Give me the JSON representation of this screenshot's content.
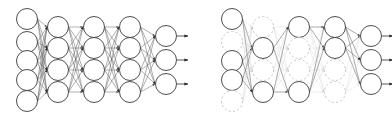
{
  "figure": {
    "name": "dropout-neural-network-comparison",
    "background": "#ffffff",
    "width": 392,
    "height": 121,
    "panels": [
      {
        "id": "standard-network",
        "name": "standard-neural-net",
        "x_offset": 0,
        "edge_color": "#555555",
        "edge_opacity": 0.85,
        "node_stroke": "#3a3a3a",
        "node_fill": "#ffffff",
        "layers": [
          {
            "id": "input-layer",
            "name": "input-layer",
            "cx": 27,
            "r": 10.5,
            "nodes": [
              {
                "id": "in-1",
                "cy": 19,
                "dropped": false
              },
              {
                "id": "in-2",
                "cy": 42,
                "dropped": false
              },
              {
                "id": "in-3",
                "cy": 61,
                "dropped": false
              },
              {
                "id": "in-4",
                "cy": 80,
                "dropped": false
              },
              {
                "id": "in-5",
                "cy": 101,
                "dropped": false
              }
            ]
          },
          {
            "id": "hidden-layer-1",
            "name": "hidden-layer-1",
            "cx": 58,
            "r": 10.5,
            "nodes": [
              {
                "id": "h1-1",
                "cy": 27,
                "dropped": false
              },
              {
                "id": "h1-2",
                "cy": 48,
                "dropped": false
              },
              {
                "id": "h1-3",
                "cy": 70,
                "dropped": false
              },
              {
                "id": "h1-4",
                "cy": 92,
                "dropped": false
              }
            ]
          },
          {
            "id": "hidden-layer-2",
            "name": "hidden-layer-2",
            "cx": 94,
            "r": 10.5,
            "nodes": [
              {
                "id": "h2-1",
                "cy": 27,
                "dropped": false
              },
              {
                "id": "h2-2",
                "cy": 48,
                "dropped": false
              },
              {
                "id": "h2-3",
                "cy": 70,
                "dropped": false
              },
              {
                "id": "h2-4",
                "cy": 92,
                "dropped": false
              }
            ]
          },
          {
            "id": "hidden-layer-3",
            "name": "hidden-layer-3",
            "cx": 130,
            "r": 10.5,
            "nodes": [
              {
                "id": "h3-1",
                "cy": 27,
                "dropped": false
              },
              {
                "id": "h3-2",
                "cy": 48,
                "dropped": false
              },
              {
                "id": "h3-3",
                "cy": 70,
                "dropped": false
              },
              {
                "id": "h3-4",
                "cy": 92,
                "dropped": false
              }
            ]
          },
          {
            "id": "output-layer",
            "name": "output-layer",
            "cx": 166,
            "r": 10.5,
            "nodes": [
              {
                "id": "out-1",
                "cy": 36,
                "dropped": false
              },
              {
                "id": "out-2",
                "cy": 60,
                "dropped": false
              },
              {
                "id": "out-3",
                "cy": 84,
                "dropped": false
              }
            ]
          }
        ],
        "output_arrows": [
          {
            "id": "out-arrow-1",
            "x1": 177,
            "y": 36,
            "x2": 188
          },
          {
            "id": "out-arrow-2",
            "x1": 177,
            "y": 60,
            "x2": 188
          },
          {
            "id": "out-arrow-3",
            "x1": 177,
            "y": 84,
            "x2": 188
          }
        ]
      },
      {
        "id": "dropout-network",
        "name": "dropout-applied-net",
        "x_offset": 205,
        "edge_color": "#555555",
        "edge_opacity": 0.9,
        "dropped_edge_color": "#c9c9c9",
        "dropped_edge_opacity": 0.55,
        "node_stroke": "#3a3a3a",
        "dropped_node_stroke": "#bdbdbd",
        "node_fill": "#ffffff",
        "dropped_dash": "2.2 2.2",
        "layers": [
          {
            "id": "input-layer",
            "name": "input-layer",
            "cx": 27,
            "r": 10.5,
            "nodes": [
              {
                "id": "in-1",
                "cy": 19,
                "dropped": false
              },
              {
                "id": "in-2",
                "cy": 42,
                "dropped": true
              },
              {
                "id": "in-3",
                "cy": 61,
                "dropped": false
              },
              {
                "id": "in-4",
                "cy": 80,
                "dropped": false
              },
              {
                "id": "in-5",
                "cy": 101,
                "dropped": true
              }
            ]
          },
          {
            "id": "hidden-layer-1",
            "name": "hidden-layer-1",
            "cx": 58,
            "r": 10.5,
            "nodes": [
              {
                "id": "h1-1",
                "cy": 27,
                "dropped": true
              },
              {
                "id": "h1-2",
                "cy": 48,
                "dropped": false
              },
              {
                "id": "h1-3",
                "cy": 70,
                "dropped": true
              },
              {
                "id": "h1-4",
                "cy": 92,
                "dropped": false
              }
            ]
          },
          {
            "id": "hidden-layer-2",
            "name": "hidden-layer-2",
            "cx": 94,
            "r": 10.5,
            "nodes": [
              {
                "id": "h2-1",
                "cy": 27,
                "dropped": false
              },
              {
                "id": "h2-2",
                "cy": 48,
                "dropped": true
              },
              {
                "id": "h2-3",
                "cy": 70,
                "dropped": true
              },
              {
                "id": "h2-4",
                "cy": 92,
                "dropped": false
              }
            ]
          },
          {
            "id": "hidden-layer-3",
            "name": "hidden-layer-3",
            "cx": 130,
            "r": 10.5,
            "nodes": [
              {
                "id": "h3-1",
                "cy": 27,
                "dropped": false
              },
              {
                "id": "h3-2",
                "cy": 48,
                "dropped": false
              },
              {
                "id": "h3-3",
                "cy": 70,
                "dropped": true
              },
              {
                "id": "h3-4",
                "cy": 92,
                "dropped": true
              }
            ]
          },
          {
            "id": "output-layer",
            "name": "output-layer",
            "cx": 166,
            "r": 10.5,
            "nodes": [
              {
                "id": "out-1",
                "cy": 36,
                "dropped": false
              },
              {
                "id": "out-2",
                "cy": 60,
                "dropped": false
              },
              {
                "id": "out-3",
                "cy": 84,
                "dropped": false
              }
            ]
          }
        ],
        "output_arrows": [
          {
            "id": "out-arrow-1",
            "x1": 177,
            "y": 36,
            "x2": 188
          },
          {
            "id": "out-arrow-2",
            "x1": 177,
            "y": 60,
            "x2": 188
          },
          {
            "id": "out-arrow-3",
            "x1": 177,
            "y": 84,
            "x2": 188
          }
        ]
      }
    ]
  }
}
